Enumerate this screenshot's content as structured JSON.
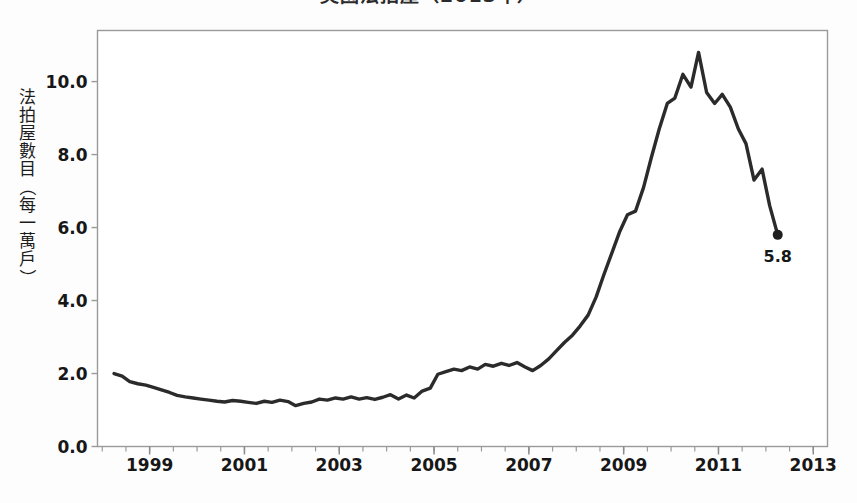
{
  "chart_data": {
    "type": "line",
    "title": "美國法拍屋（2013年）",
    "xlabel": "",
    "ylabel": "法拍屋數目（每一萬戶）",
    "ylim": [
      0.0,
      11.4
    ],
    "xlim": [
      1997.9,
      2013.3
    ],
    "grid": false,
    "legend": null,
    "yticks": [
      "0.0",
      "2.0",
      "4.0",
      "6.0",
      "8.0",
      "10.0"
    ],
    "ytick_values": [
      0.0,
      2.0,
      4.0,
      6.0,
      8.0,
      10.0
    ],
    "xticks": [
      "1999",
      "2001",
      "2003",
      "2005",
      "2007",
      "2009",
      "2011",
      "2013"
    ],
    "xtick_values": [
      1999,
      2001,
      2003,
      2005,
      2007,
      2009,
      2011,
      2013
    ],
    "minor_xtick_interval": 0.5,
    "line_color": "#2b2b2b",
    "line_width": 3.4,
    "annotations": [
      {
        "text": "5.8",
        "x": 2012.25,
        "y": 5.8,
        "marker": "filled-circle"
      }
    ],
    "series": [
      {
        "name": "法拍屋數目",
        "x": [
          1998.25,
          1998.42,
          1998.58,
          1998.75,
          1998.92,
          1999.08,
          1999.25,
          1999.42,
          1999.58,
          1999.75,
          1999.92,
          2000.08,
          2000.25,
          2000.42,
          2000.58,
          2000.75,
          2000.92,
          2001.08,
          2001.25,
          2001.42,
          2001.58,
          2001.75,
          2001.92,
          2002.08,
          2002.25,
          2002.42,
          2002.58,
          2002.75,
          2002.92,
          2003.08,
          2003.25,
          2003.42,
          2003.58,
          2003.75,
          2003.92,
          2004.08,
          2004.25,
          2004.42,
          2004.58,
          2004.75,
          2004.92,
          2005.08,
          2005.25,
          2005.42,
          2005.58,
          2005.75,
          2005.92,
          2006.08,
          2006.25,
          2006.42,
          2006.58,
          2006.75,
          2006.92,
          2007.08,
          2007.25,
          2007.42,
          2007.58,
          2007.75,
          2007.92,
          2008.08,
          2008.25,
          2008.42,
          2008.58,
          2008.75,
          2008.92,
          2009.08,
          2009.25,
          2009.42,
          2009.58,
          2009.75,
          2009.92,
          2010.08,
          2010.25,
          2010.42,
          2010.58,
          2010.75,
          2010.92,
          2011.08,
          2011.25,
          2011.42,
          2011.58,
          2011.75,
          2011.92,
          2012.08,
          2012.25
        ],
        "values": [
          2.0,
          1.93,
          1.78,
          1.72,
          1.68,
          1.62,
          1.55,
          1.48,
          1.4,
          1.36,
          1.33,
          1.3,
          1.27,
          1.24,
          1.22,
          1.26,
          1.24,
          1.21,
          1.18,
          1.24,
          1.21,
          1.27,
          1.23,
          1.12,
          1.18,
          1.22,
          1.3,
          1.27,
          1.33,
          1.3,
          1.36,
          1.3,
          1.34,
          1.29,
          1.35,
          1.42,
          1.3,
          1.41,
          1.33,
          1.52,
          1.6,
          1.98,
          2.05,
          2.12,
          2.08,
          2.18,
          2.12,
          2.25,
          2.2,
          2.28,
          2.22,
          2.3,
          2.18,
          2.08,
          2.22,
          2.4,
          2.62,
          2.85,
          3.05,
          3.3,
          3.6,
          4.1,
          4.7,
          5.3,
          5.9,
          6.35,
          6.45,
          7.1,
          7.9,
          8.7,
          9.4,
          9.8,
          9.1,
          8.4,
          8.15,
          8.7,
          7.95,
          7.2,
          8.45,
          8.15,
          8.85,
          8.6,
          9.05,
          8.6,
          9.1
        ],
        "values_continued_x": [
          2010.08,
          2010.25,
          2010.42,
          2010.58,
          2010.75,
          2010.92,
          2011.08,
          2011.25,
          2011.42,
          2011.58,
          2011.75,
          2011.92,
          2012.08,
          2012.25
        ],
        "values_continued": [
          9.55,
          10.2,
          9.85,
          10.8,
          9.7,
          9.4,
          9.65,
          9.3,
          8.7,
          8.3,
          7.3,
          7.6,
          6.6,
          5.8
        ]
      }
    ],
    "notable_points": [
      {
        "label": "start",
        "x": 1998.25,
        "y": 2.0
      },
      {
        "label": "trough",
        "x": 2002.08,
        "y": 1.12
      },
      {
        "label": "first-peak",
        "x": 2008.75,
        "y": 9.8
      },
      {
        "label": "post-peak-dip",
        "x": 2009.25,
        "y": 7.2
      },
      {
        "label": "maximum",
        "x": 2010.6,
        "y": 10.8
      },
      {
        "label": "end",
        "x": 2012.25,
        "y": 5.8
      }
    ]
  },
  "axis": {
    "y_title": "法拍屋數目（每一萬戶）",
    "y_title_chars": [
      "法",
      "拍",
      "屋",
      "數",
      "目",
      "（",
      "每",
      "一",
      "萬",
      "戶",
      "）"
    ]
  },
  "figure": {
    "title": "美國法拍屋（2013年）"
  }
}
